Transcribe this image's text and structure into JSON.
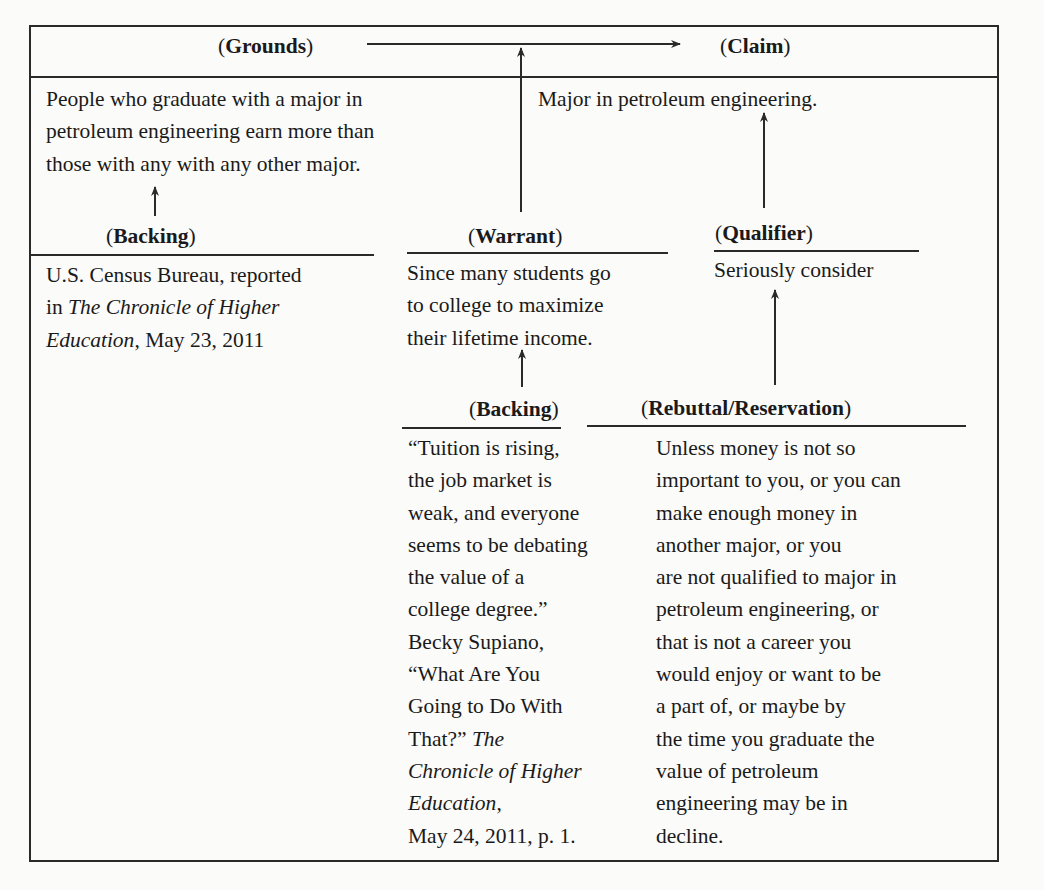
{
  "diagram": {
    "type": "Toulmin argument model",
    "grounds": {
      "label": "Grounds",
      "lines": [
        "People who graduate with a major in",
        "petroleum engineering earn more than",
        "those with any with any other major."
      ]
    },
    "claim": {
      "label": "Claim",
      "lines": [
        "Major in petroleum engineering."
      ]
    },
    "backing_grounds": {
      "label": "Backing",
      "line1": "U.S. Census Bureau, reported",
      "line2_prefix": "in ",
      "line2_italic": "The Chronicle of Higher",
      "line3_italic": "Education",
      "line3_suffix": ", May 23, 2011"
    },
    "warrant": {
      "label": "Warrant",
      "lines": [
        "Since many students go",
        "to college to maximize",
        "their lifetime income."
      ]
    },
    "qualifier": {
      "label": "Qualifier",
      "lines": [
        "Seriously consider"
      ]
    },
    "backing_warrant": {
      "label": "Backing",
      "lines": [
        "“Tuition is rising,",
        "the job market is",
        "weak, and everyone",
        "seems to be debating",
        "the value of a",
        "college degree.”",
        "Becky Supiano,",
        "“What Are You",
        "Going to Do With"
      ],
      "line10_prefix": "That?” ",
      "line10_italic": "The",
      "line11_italic": "Chronicle of Higher",
      "line12_italic": "Education",
      "line12_suffix": ",",
      "line13": "May 24, 2011, p. 1."
    },
    "rebuttal": {
      "label": "Rebuttal/Reservation",
      "lines": [
        "Unless money is not so",
        "important to you, or you can",
        "make enough money in",
        "another major, or you",
        "are not qualified to major in",
        "petroleum engineering, or",
        "that is not a career you",
        "would enjoy or want to be",
        "a part of, or maybe by",
        "the time you graduate the",
        "value of petroleum",
        "engineering may be in",
        "decline."
      ]
    },
    "connections": [
      {
        "from": "grounds",
        "to": "claim",
        "kind": "horizontal-arrow"
      },
      {
        "from": "warrant",
        "to": "grounds-claim-arrow",
        "kind": "vertical-arrow"
      },
      {
        "from": "backing_grounds",
        "to": "grounds",
        "kind": "vertical-arrow"
      },
      {
        "from": "qualifier",
        "to": "claim",
        "kind": "vertical-arrow"
      },
      {
        "from": "backing_warrant",
        "to": "warrant",
        "kind": "vertical-arrow"
      },
      {
        "from": "rebuttal",
        "to": "qualifier",
        "kind": "vertical-arrow"
      }
    ],
    "line_color": "#2a2a2a",
    "text_color": "#1a1a1a",
    "background": "#fbfbf9"
  }
}
